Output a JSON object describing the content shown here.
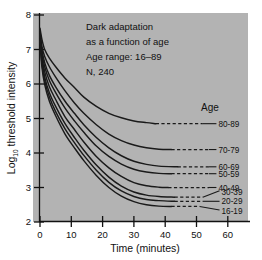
{
  "chart_data": {
    "type": "line",
    "annotation_lines": [
      "Dark adaptation",
      "as a function of age",
      "Age range: 16–89",
      "N, 240"
    ],
    "xlabel": "Time (minutes)",
    "ylabel_prefix": "Log",
    "ylabel_subscript": "10",
    "ylabel_suffix": " threshold intensity",
    "ylabel_full": "Log10 threshold intensity",
    "xlim": [
      0,
      66
    ],
    "ylim": [
      2,
      8
    ],
    "xticks": [
      0,
      10,
      20,
      30,
      40,
      50,
      60
    ],
    "yticks": [
      2,
      3,
      4,
      5,
      6,
      7,
      8
    ],
    "xtick_labels": [
      "0",
      "10",
      "20",
      "30",
      "40",
      "50",
      "60"
    ],
    "ytick_labels": [
      "2",
      "3",
      "4",
      "5",
      "6",
      "7",
      "8"
    ],
    "grid": false,
    "legend_title": "Age",
    "legend_position": "right",
    "line_color": "#1a1a1a",
    "plot_background": "#b3b3b3",
    "figure_background": "#ffffff",
    "series": [
      {
        "name": "80-89",
        "label": "80-89",
        "asymptote": 4.85,
        "label_x": 57,
        "label_y": 4.85,
        "dash_start_x": 37,
        "dash_end_x": 52,
        "points": [
          [
            0,
            7.62
          ],
          [
            0.6,
            7.3
          ],
          [
            1.5,
            7.0
          ],
          [
            3,
            6.75
          ],
          [
            5,
            6.5
          ],
          [
            8,
            6.17
          ],
          [
            11,
            5.9
          ],
          [
            14,
            5.62
          ],
          [
            18,
            5.35
          ],
          [
            22,
            5.15
          ],
          [
            26,
            5.02
          ],
          [
            30,
            4.93
          ],
          [
            34,
            4.88
          ],
          [
            37,
            4.85
          ]
        ]
      },
      {
        "name": "70-79",
        "label": "70-79",
        "asymptote": 4.1,
        "label_x": 57,
        "label_y": 4.1,
        "dash_start_x": 42,
        "dash_end_x": 54,
        "points": [
          [
            0,
            7.55
          ],
          [
            0.6,
            7.1
          ],
          [
            1.5,
            6.8
          ],
          [
            3,
            6.5
          ],
          [
            5,
            6.2
          ],
          [
            8,
            5.8
          ],
          [
            11,
            5.45
          ],
          [
            14,
            5.15
          ],
          [
            18,
            4.82
          ],
          [
            22,
            4.55
          ],
          [
            26,
            4.36
          ],
          [
            30,
            4.23
          ],
          [
            34,
            4.15
          ],
          [
            38,
            4.11
          ],
          [
            42,
            4.1
          ]
        ]
      },
      {
        "name": "60-69",
        "label": "60-69",
        "asymptote": 3.6,
        "label_x": 57,
        "label_y": 3.6,
        "dash_start_x": 44,
        "dash_end_x": 54,
        "points": [
          [
            0,
            7.5
          ],
          [
            0.6,
            7.0
          ],
          [
            1.5,
            6.62
          ],
          [
            3,
            6.25
          ],
          [
            5,
            5.92
          ],
          [
            8,
            5.5
          ],
          [
            11,
            5.15
          ],
          [
            14,
            4.82
          ],
          [
            18,
            4.45
          ],
          [
            22,
            4.15
          ],
          [
            26,
            3.92
          ],
          [
            30,
            3.76
          ],
          [
            34,
            3.67
          ],
          [
            38,
            3.62
          ],
          [
            44,
            3.6
          ]
        ]
      },
      {
        "name": "50-59",
        "label": "50-59",
        "asymptote": 3.4,
        "label_x": 57,
        "label_y": 3.4,
        "dash_start_x": 42,
        "dash_end_x": 54,
        "points": [
          [
            0,
            7.45
          ],
          [
            0.6,
            6.9
          ],
          [
            1.5,
            6.5
          ],
          [
            3,
            6.1
          ],
          [
            5,
            5.75
          ],
          [
            8,
            5.3
          ],
          [
            11,
            4.93
          ],
          [
            14,
            4.6
          ],
          [
            18,
            4.2
          ],
          [
            22,
            3.9
          ],
          [
            26,
            3.68
          ],
          [
            30,
            3.53
          ],
          [
            34,
            3.45
          ],
          [
            38,
            3.41
          ],
          [
            42,
            3.4
          ]
        ]
      },
      {
        "name": "40-49",
        "label": "40-49",
        "asymptote": 3.0,
        "label_x": 57,
        "label_y": 3.0,
        "dash_start_x": 41,
        "dash_end_x": 54,
        "points": [
          [
            0,
            7.4
          ],
          [
            0.6,
            6.8
          ],
          [
            1.5,
            6.35
          ],
          [
            3,
            5.92
          ],
          [
            5,
            5.55
          ],
          [
            8,
            5.05
          ],
          [
            11,
            4.68
          ],
          [
            14,
            4.32
          ],
          [
            18,
            3.9
          ],
          [
            22,
            3.57
          ],
          [
            26,
            3.32
          ],
          [
            30,
            3.14
          ],
          [
            34,
            3.05
          ],
          [
            38,
            3.01
          ],
          [
            41,
            3.0
          ]
        ]
      },
      {
        "name": "30-39",
        "label": "30-39",
        "asymptote": 2.72,
        "label_x": 58,
        "label_y": 2.88,
        "dash_start_x": 43,
        "dash_end_x": 52,
        "points": [
          [
            0,
            7.35
          ],
          [
            0.6,
            6.7
          ],
          [
            1.5,
            6.2
          ],
          [
            3,
            5.75
          ],
          [
            5,
            5.35
          ],
          [
            8,
            4.85
          ],
          [
            11,
            4.45
          ],
          [
            14,
            4.08
          ],
          [
            18,
            3.65
          ],
          [
            22,
            3.3
          ],
          [
            26,
            3.04
          ],
          [
            30,
            2.87
          ],
          [
            34,
            2.78
          ],
          [
            38,
            2.74
          ],
          [
            43,
            2.72
          ]
        ]
      },
      {
        "name": "20-29",
        "label": "20-29",
        "asymptote": 2.6,
        "label_x": 58,
        "label_y": 2.6,
        "dash_start_x": 43,
        "dash_end_x": 52,
        "points": [
          [
            0,
            7.3
          ],
          [
            0.6,
            6.6
          ],
          [
            1.5,
            6.1
          ],
          [
            3,
            5.62
          ],
          [
            5,
            5.2
          ],
          [
            8,
            4.7
          ],
          [
            11,
            4.3
          ],
          [
            14,
            3.93
          ],
          [
            18,
            3.5
          ],
          [
            22,
            3.15
          ],
          [
            26,
            2.9
          ],
          [
            30,
            2.74
          ],
          [
            34,
            2.65
          ],
          [
            38,
            2.62
          ],
          [
            43,
            2.6
          ]
        ]
      },
      {
        "name": "16-19",
        "label": "16-19",
        "asymptote": 2.45,
        "label_x": 58,
        "label_y": 2.32,
        "dash_start_x": 42,
        "dash_end_x": 51,
        "points": [
          [
            0,
            7.25
          ],
          [
            0.6,
            6.5
          ],
          [
            1.5,
            5.98
          ],
          [
            3,
            5.5
          ],
          [
            5,
            5.08
          ],
          [
            8,
            4.55
          ],
          [
            11,
            4.15
          ],
          [
            14,
            3.78
          ],
          [
            18,
            3.35
          ],
          [
            22,
            3.0
          ],
          [
            26,
            2.75
          ],
          [
            30,
            2.59
          ],
          [
            34,
            2.5
          ],
          [
            38,
            2.46
          ],
          [
            42,
            2.45
          ]
        ]
      }
    ]
  }
}
